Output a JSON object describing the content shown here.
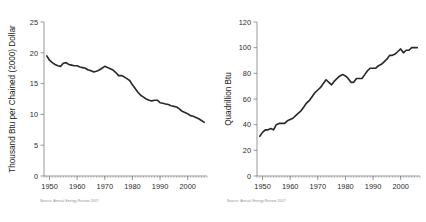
{
  "figure": {
    "background": "#ffffff",
    "line_color": "#2a2a2a",
    "axis_color": "#6e6e6e",
    "text_color": "#2b2b2b"
  },
  "panels": [
    {
      "id": "energy-intensity",
      "source_note": "Source:  Annual Energy Review 2007"
    },
    {
      "id": "energy-consumption",
      "source_note": "Source:  Annual Energy Review 2007"
    }
  ],
  "chart_data": [
    {
      "type": "line",
      "title": "",
      "xlabel": "",
      "ylabel": "Thousand Btu per Chained (2000) Dollar",
      "xlim": [
        1948,
        2007
      ],
      "ylim": [
        0,
        25
      ],
      "yticks": [
        0,
        5,
        10,
        15,
        20,
        25
      ],
      "ytick_labels": [
        "0",
        "5",
        "10",
        "15",
        "20",
        "25"
      ],
      "xticks": [
        1950,
        1960,
        1970,
        1980,
        1990,
        2000
      ],
      "xtick_labels": [
        "1950",
        "1960",
        "1970",
        "1980",
        "1990",
        "2000"
      ],
      "minor_xtick_step": 1,
      "grid": false,
      "legend": false,
      "series": [
        {
          "name": "Energy intensity",
          "x": [
            1949,
            1950,
            1951,
            1952,
            1953,
            1954,
            1955,
            1956,
            1957,
            1958,
            1959,
            1960,
            1961,
            1962,
            1963,
            1964,
            1965,
            1966,
            1967,
            1968,
            1969,
            1970,
            1971,
            1972,
            1973,
            1974,
            1975,
            1976,
            1977,
            1978,
            1979,
            1980,
            1981,
            1982,
            1983,
            1984,
            1985,
            1986,
            1987,
            1988,
            1989,
            1990,
            1991,
            1992,
            1993,
            1994,
            1995,
            1996,
            1997,
            1998,
            1999,
            2000,
            2001,
            2002,
            2003,
            2004,
            2005,
            2006
          ],
          "values": [
            19.5,
            18.8,
            18.4,
            18.1,
            17.9,
            17.8,
            18.3,
            18.4,
            18.1,
            18.0,
            17.9,
            17.9,
            17.7,
            17.6,
            17.5,
            17.2,
            17.1,
            16.9,
            17.0,
            17.2,
            17.5,
            17.8,
            17.6,
            17.4,
            17.2,
            16.8,
            16.3,
            16.3,
            16.1,
            15.8,
            15.5,
            14.8,
            14.2,
            13.6,
            13.1,
            12.8,
            12.5,
            12.3,
            12.2,
            12.3,
            12.3,
            11.9,
            11.8,
            11.7,
            11.6,
            11.4,
            11.3,
            11.2,
            10.9,
            10.5,
            10.3,
            10.1,
            9.8,
            9.7,
            9.5,
            9.3,
            9.0,
            8.7
          ]
        }
      ]
    },
    {
      "type": "line",
      "title": "",
      "xlabel": "",
      "ylabel": "Quadrillion Btu",
      "xlim": [
        1948,
        2007
      ],
      "ylim": [
        0,
        120
      ],
      "yticks": [
        0,
        20,
        40,
        60,
        80,
        100,
        120
      ],
      "ytick_labels": [
        "0",
        "20",
        "40",
        "60",
        "80",
        "100",
        "120"
      ],
      "xticks": [
        1950,
        1960,
        1970,
        1980,
        1990,
        2000
      ],
      "xtick_labels": [
        "1950",
        "1960",
        "1970",
        "1980",
        "1990",
        "2000"
      ],
      "minor_xtick_step": 1,
      "grid": false,
      "legend": false,
      "series": [
        {
          "name": "Total energy consumption",
          "x": [
            1949,
            1950,
            1951,
            1952,
            1953,
            1954,
            1955,
            1956,
            1957,
            1958,
            1959,
            1960,
            1961,
            1962,
            1963,
            1964,
            1965,
            1966,
            1967,
            1968,
            1969,
            1970,
            1971,
            1972,
            1973,
            1974,
            1975,
            1976,
            1977,
            1978,
            1979,
            1980,
            1981,
            1982,
            1983,
            1984,
            1985,
            1986,
            1987,
            1988,
            1989,
            1990,
            1991,
            1992,
            1993,
            1994,
            1995,
            1996,
            1997,
            1998,
            1999,
            2000,
            2001,
            2002,
            2003,
            2004,
            2005,
            2006
          ],
          "values": [
            31.0,
            34.0,
            36.0,
            36.0,
            37.0,
            36.0,
            40.0,
            41.0,
            41.0,
            41.0,
            43.0,
            44.0,
            45.0,
            47.0,
            49.0,
            51.0,
            54.0,
            57.0,
            59.0,
            62.0,
            65.0,
            67.0,
            69.0,
            72.0,
            75.0,
            73.0,
            71.0,
            74.0,
            76.0,
            78.0,
            79.0,
            78.0,
            76.0,
            73.0,
            73.0,
            76.0,
            76.0,
            76.0,
            79.0,
            82.0,
            84.0,
            84.0,
            84.0,
            86.0,
            87.0,
            89.0,
            91.0,
            94.0,
            94.0,
            95.0,
            97.0,
            99.0,
            96.0,
            98.0,
            98.0,
            100.0,
            100.0,
            100.0
          ]
        }
      ]
    }
  ]
}
